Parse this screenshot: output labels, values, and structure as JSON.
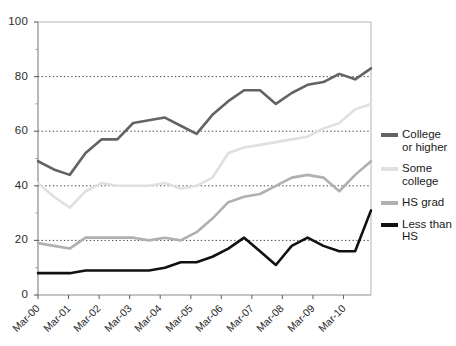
{
  "chart_data": {
    "type": "line",
    "title": "",
    "xlabel": "",
    "ylabel": "",
    "ylim": [
      0,
      100
    ],
    "yticks": [
      0,
      20,
      40,
      60,
      80,
      100
    ],
    "yminor": [
      10,
      30,
      50,
      70,
      90
    ],
    "gridlines": [
      20,
      40,
      60,
      80
    ],
    "grid": "horizontal-dotted",
    "legend_position": "right",
    "categories": [
      "Mar-00",
      "Sep-00",
      "Mar-01",
      "Sep-01",
      "Mar-02",
      "Sep-02",
      "Mar-03",
      "Sep-03",
      "Mar-04",
      "Sep-04",
      "Mar-05",
      "Sep-05",
      "Mar-06",
      "Sep-06",
      "Mar-07",
      "Sep-07",
      "Mar-08",
      "Sep-08",
      "Mar-09",
      "Sep-09",
      "Mar-10",
      "Sep-10"
    ],
    "xticks": [
      "Mar-00",
      "Mar-01",
      "Mar-02",
      "Mar-03",
      "Mar-04",
      "Mar-05",
      "Mar-06",
      "Mar-07",
      "Mar-08",
      "Mar-09",
      "Mar-10"
    ],
    "series": [
      {
        "name": "College or higher",
        "label": "College\nor higher",
        "color": "#636363",
        "values": [
          49,
          46,
          44,
          52,
          57,
          57,
          63,
          64,
          65,
          62,
          59,
          66,
          71,
          75,
          75,
          70,
          74,
          77,
          78,
          81,
          79,
          83
        ]
      },
      {
        "name": "Some college",
        "label": "Some\ncollege",
        "color": "#e0e0e0",
        "values": [
          41,
          36,
          32,
          38,
          41,
          40,
          40,
          40,
          41,
          39,
          40,
          43,
          52,
          54,
          55,
          56,
          57,
          58,
          61,
          63,
          68,
          70
        ]
      },
      {
        "name": "HS grad",
        "label": "HS grad",
        "color": "#b0b0b0",
        "values": [
          19,
          18,
          17,
          21,
          21,
          21,
          21,
          20,
          21,
          20,
          23,
          28,
          34,
          36,
          37,
          40,
          43,
          44,
          43,
          38,
          44,
          49
        ]
      },
      {
        "name": "Less than HS",
        "label": "Less than\nHS",
        "color": "#111111",
        "values": [
          8,
          8,
          8,
          9,
          9,
          9,
          9,
          9,
          10,
          12,
          12,
          14,
          17,
          21,
          16,
          11,
          18,
          21,
          18,
          16,
          16,
          31
        ]
      }
    ]
  },
  "axis": {
    "y_labels": [
      "100",
      "80",
      "60",
      "40",
      "20",
      "0"
    ],
    "x_labels": [
      "Mar-00",
      "Mar-01",
      "Mar-02",
      "Mar-03",
      "Mar-04",
      "Mar-05",
      "Mar-06",
      "Mar-07",
      "Mar-08",
      "Mar-09",
      "Mar-10"
    ]
  },
  "legend": {
    "items": [
      {
        "label_line1": "College",
        "label_line2": "or higher",
        "color": "#636363"
      },
      {
        "label_line1": "Some",
        "label_line2": "college",
        "color": "#e0e0e0"
      },
      {
        "label_line1": "HS grad",
        "label_line2": "",
        "color": "#b0b0b0"
      },
      {
        "label_line1": "Less than",
        "label_line2": "HS",
        "color": "#111111"
      }
    ]
  }
}
